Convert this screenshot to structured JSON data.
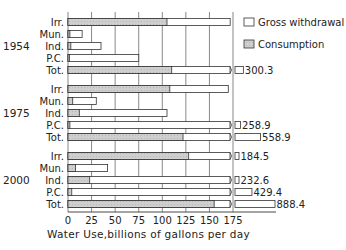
{
  "chart_data": {
    "type": "bar",
    "orientation": "horizontal",
    "title": "",
    "xlabel": "Water Use, billions of gallons per day",
    "ylabel": "",
    "xlim": [
      0,
      175
    ],
    "x_ticks": [
      0,
      25,
      50,
      75,
      100,
      125,
      150,
      175
    ],
    "grid": true,
    "legend_position": "upper right",
    "legend": [
      {
        "name": "Gross withdrawal",
        "style": "white-outline"
      },
      {
        "name": "Consumption",
        "style": "gray-hatched"
      }
    ],
    "categories": [
      "Irr.",
      "Mun.",
      "Ind.",
      "P.C.",
      "Tot."
    ],
    "groups": [
      {
        "year": "1954",
        "gross_withdrawal": [
          172,
          15,
          35,
          75,
          300.3
        ],
        "consumption": [
          105,
          2,
          3,
          1,
          110
        ],
        "labels": [
          "",
          "",
          "",
          "",
          "300.3"
        ],
        "broken": [
          false,
          false,
          false,
          false,
          true
        ]
      },
      {
        "year": "1975",
        "gross_withdrawal": [
          170,
          30,
          105,
          258.9,
          558.9
        ],
        "consumption": [
          108,
          5,
          12,
          2,
          122
        ],
        "labels": [
          "",
          "",
          "",
          "258.9",
          "558.9"
        ],
        "broken": [
          false,
          false,
          false,
          true,
          true
        ]
      },
      {
        "year": "2000",
        "gross_withdrawal": [
          184.5,
          42,
          232.6,
          429.4,
          888.4
        ],
        "consumption": [
          128,
          8,
          23,
          4,
          155
        ],
        "labels": [
          "184.5",
          "",
          "232.6",
          "429.4",
          "888.4"
        ],
        "broken": [
          true,
          false,
          true,
          true,
          true
        ]
      }
    ]
  },
  "axis": {
    "ticks": [
      "0",
      "25",
      "50",
      "75",
      "100",
      "125",
      "150",
      "175"
    ],
    "xlabel": "Water Use,billions of gallons per day"
  },
  "legend": {
    "gross": "Gross withdrawal",
    "consumption": "Consumption"
  },
  "colors": {
    "consumption_fill": "#cfcfcf",
    "outline": "#333333",
    "grid": "#555555"
  }
}
